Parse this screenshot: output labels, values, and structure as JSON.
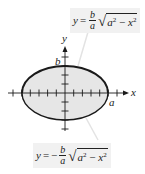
{
  "diagram": {
    "title": "",
    "type": "ellipse-graph",
    "axes": {
      "x_label": "x",
      "y_label": "y",
      "x_ticks_each_side": 6,
      "y_ticks_each_side": 3
    },
    "ellipse": {
      "fill_color": "#e6e6e6",
      "stroke_color": "#1a1a1a",
      "upper_stroke_width": 2,
      "lower_stroke_width": 1.3,
      "semi_major_label": "a",
      "semi_minor_label": "b"
    },
    "upper_formula": {
      "lhs": "y",
      "equals": "=",
      "sign": "",
      "frac_num": "b",
      "frac_den": "a",
      "radicand_a": "a",
      "radicand_a_exp": "2",
      "radicand_op": " − ",
      "radicand_x": "x",
      "radicand_x_exp": "2"
    },
    "lower_formula": {
      "lhs": "y",
      "equals": "=",
      "sign": "−",
      "frac_num": "b",
      "frac_den": "a",
      "radicand_a": "a",
      "radicand_a_exp": "2",
      "radicand_op": " − ",
      "radicand_x": "x",
      "radicand_x_exp": "2"
    },
    "colors": {
      "background": "#ffffff",
      "formula_background": "#f1f1f1",
      "leader_line": "#e3e3e3"
    }
  }
}
